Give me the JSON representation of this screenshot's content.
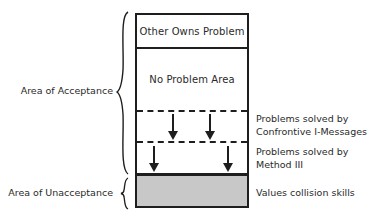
{
  "diagram": {
    "type": "behavior-window",
    "regions": [
      {
        "id": "other-owns",
        "label": "Other Owns Problem",
        "border_below": "solid"
      },
      {
        "id": "no-problem",
        "label": "No Problem Area",
        "border_below": "dashed"
      },
      {
        "id": "confrontive",
        "label": "",
        "border_below": "dashed",
        "arrows": 2
      },
      {
        "id": "method-three",
        "label": "",
        "border_below": "thick",
        "arrows": 2
      },
      {
        "id": "unacceptance",
        "label": "",
        "fill": "#c8c8c8"
      }
    ],
    "left_labels": {
      "acceptance": "Area of Acceptance",
      "unacceptance": "Area of Unacceptance"
    },
    "right_labels": {
      "confrontive_line1": "Problems solved by",
      "confrontive_line2": "Confrontive I-Messages",
      "method_line1": "Problems solved by",
      "method_line2": "Method III",
      "values": "Values collision skills"
    },
    "icons": {
      "arrow": "down-arrow-icon",
      "brace": "left-curly-brace-icon"
    },
    "colors": {
      "line": "#1e1e1e",
      "text": "#2a2a2a",
      "grey_fill": "#c8c8c8",
      "background": "#ffffff"
    }
  }
}
